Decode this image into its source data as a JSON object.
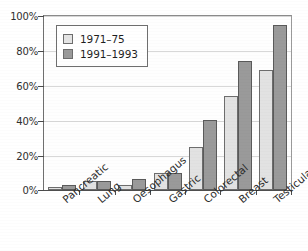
{
  "chart_data": {
    "type": "bar",
    "title": "",
    "subtitle": "",
    "xlabel": "",
    "ylabel": "",
    "ylim": [
      0,
      100
    ],
    "y_ticks": [
      "0%",
      "20%",
      "40%",
      "60%",
      "80%",
      "100%"
    ],
    "y_tick_values": [
      0,
      20,
      40,
      60,
      80,
      100
    ],
    "grid": true,
    "legend_position": "upper-left-inside",
    "categories": [
      "Pancreatic",
      "Lung",
      "Oesophagus",
      "Gastric",
      "Colorectal",
      "Breast",
      "Testicular"
    ],
    "series": [
      {
        "name": "1971–75",
        "color": "#e2e2e2",
        "values": [
          2,
          5,
          3,
          10,
          25,
          54,
          69
        ]
      },
      {
        "name": "1991–1993",
        "color": "#9a9a9a",
        "values": [
          3,
          5,
          6.5,
          10,
          40,
          74,
          95
        ]
      }
    ]
  },
  "legend": {
    "entries": [
      {
        "label": "1971–75"
      },
      {
        "label": "1991–1993"
      }
    ]
  },
  "colors": {
    "series_1971_75": "#e2e2e2",
    "series_1991_1993": "#9a9a9a",
    "axis": "#4f4f4f",
    "grid": "#d8d8d8",
    "text": "#2b2b2b",
    "background": "#ffffff"
  }
}
